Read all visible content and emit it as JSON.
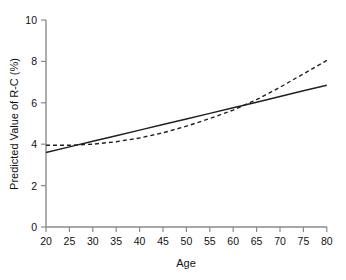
{
  "chart_data": {
    "type": "line",
    "title": "",
    "xlabel": "Age",
    "ylabel": "Predicted Value of R-C (%)",
    "xlim": [
      20,
      80
    ],
    "ylim": [
      0,
      10
    ],
    "grid": false,
    "legend": "none",
    "xticks": [
      20,
      25,
      30,
      35,
      40,
      45,
      50,
      55,
      60,
      65,
      70,
      75,
      80
    ],
    "xtick_labels": [
      "20",
      "25",
      "30",
      "35",
      "40",
      "45",
      "50",
      "55",
      "60",
      "65",
      "70",
      "75",
      "80"
    ],
    "yticks": [
      0,
      2,
      4,
      6,
      8,
      10
    ],
    "ytick_labels": [
      "0",
      "2",
      "4",
      "6",
      "8",
      "10"
    ],
    "x": [
      20,
      25,
      30,
      35,
      40,
      45,
      50,
      55,
      60,
      65,
      70,
      75,
      80
    ],
    "series": [
      {
        "name": "linear-fit",
        "style": "solid",
        "color": "#202020",
        "values": [
          3.6,
          3.87,
          4.14,
          4.41,
          4.68,
          4.95,
          5.22,
          5.49,
          5.76,
          6.03,
          6.3,
          6.58,
          6.85
        ]
      },
      {
        "name": "spline-fit",
        "style": "dashed",
        "color": "#202020",
        "values": [
          3.95,
          3.95,
          4.0,
          4.12,
          4.3,
          4.55,
          4.87,
          5.24,
          5.65,
          6.15,
          6.75,
          7.4,
          8.05
        ]
      }
    ],
    "annotations": [
      {
        "label": "first-crossing",
        "x": 25,
        "y": 3.87
      },
      {
        "label": "second-crossing",
        "x": 62,
        "y": 5.9
      }
    ]
  },
  "axes": {
    "x_label": "Age",
    "y_label": "Predicted Value of R-C (%)"
  }
}
